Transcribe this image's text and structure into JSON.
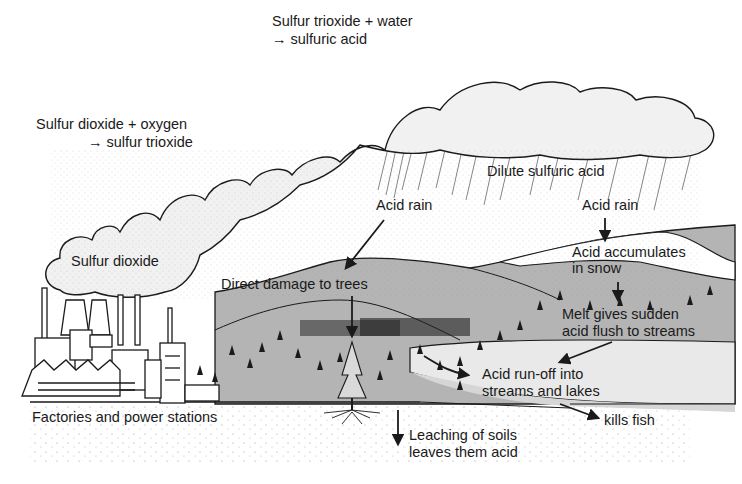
{
  "diagram": {
    "colors": {
      "background": "#ffffff",
      "cloud_fill": "#f1f1f1",
      "outline": "#1a1a1a",
      "hill": "#b7b7b7",
      "hill_dark": "#a4a4a4",
      "lake": "#e8e8e8",
      "snow": "#ffffff",
      "ground_dots": "#9a9a9a"
    },
    "labels": {
      "sulfur_trioxide_water_1": "Sulfur trioxide + water",
      "sulfur_trioxide_water_2": "→ sulfuric acid",
      "sulfur_dioxide_oxygen_1": "Sulfur dioxide + oxygen",
      "sulfur_dioxide_oxygen_2": "→ sulfur trioxide",
      "sulfur_dioxide": "Sulfur dioxide",
      "dilute_sulfuric_acid": "Dilute sulfuric acid",
      "acid_rain_left": "Acid rain",
      "acid_rain_right": "Acid rain",
      "acid_accumulates_1": "Acid accumulates",
      "acid_accumulates_2": "in snow",
      "direct_damage": "Direct damage to trees",
      "melt_1": "Melt gives sudden",
      "melt_2": "acid flush to streams",
      "runoff_1": "Acid run-off into",
      "runoff_2": "streams and lakes",
      "kills_fish": "kills fish",
      "factories": "Factories and power stations",
      "leaching_1": "Leaching of soils",
      "leaching_2": "leaves them acid"
    },
    "icons": [
      "cloud-icon",
      "factory-icon",
      "tree-icon",
      "arrow-icon",
      "rain-icon"
    ]
  }
}
